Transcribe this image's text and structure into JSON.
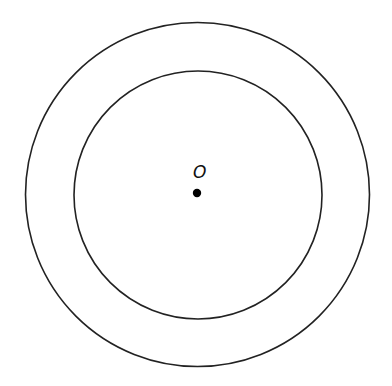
{
  "diagram": {
    "center": {
      "label": "O",
      "x": 197,
      "y": 193
    },
    "circles": [
      {
        "name": "outer-circle",
        "cx": 197.5,
        "cy": 194.5,
        "r": 172
      },
      {
        "name": "inner-circle",
        "cx": 198,
        "cy": 195,
        "r": 124
      }
    ],
    "colors": {
      "stroke": "#222222",
      "point": "#000000",
      "background": "#ffffff"
    }
  }
}
